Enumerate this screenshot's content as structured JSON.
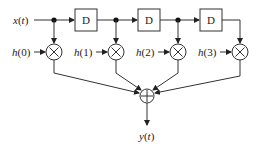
{
  "diagram": {
    "input_label": "x(t)",
    "output_label": "y(t)",
    "delay_label": "D",
    "delays": [
      {
        "label": "D",
        "x": 75
      },
      {
        "label": "D",
        "x": 138
      },
      {
        "label": "D",
        "x": 200
      }
    ],
    "taps": [
      {
        "coef": "h(0)",
        "x": 54
      },
      {
        "coef": "h(1)",
        "x": 116
      },
      {
        "coef": "h(2)",
        "x": 178
      },
      {
        "coef": "h(3)",
        "x": 240
      }
    ],
    "multiplier_symbol": "×",
    "adder_symbol": "+",
    "colors": {
      "line": "#333333",
      "background": "#ffffff"
    }
  }
}
